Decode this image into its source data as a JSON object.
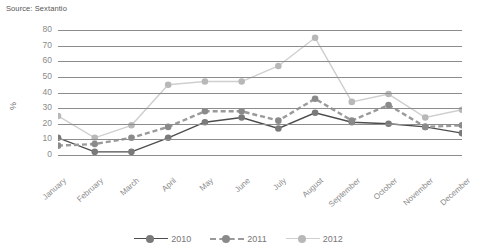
{
  "source": {
    "label": "Source: Sextantio"
  },
  "chart_data": {
    "type": "line",
    "title": "",
    "subtitle": "",
    "xlabel": "",
    "ylabel": "%",
    "ylim": [
      0,
      80
    ],
    "ytick_step": 10,
    "yticks": [
      80,
      70,
      60,
      50,
      40,
      30,
      20,
      10,
      0
    ],
    "grid": true,
    "legend_position": "bottom",
    "categories": [
      "January",
      "February",
      "March",
      "April",
      "May",
      "June",
      "July",
      "August",
      "September",
      "October",
      "November",
      "December"
    ],
    "series": [
      {
        "name": "2010",
        "color": "#4d4d4d",
        "marker_color": "#7a7a7a",
        "dash": "none",
        "values": [
          11,
          2,
          2,
          11,
          21,
          24,
          17,
          27,
          21,
          20,
          18,
          14
        ]
      },
      {
        "name": "2011",
        "color": "#9a9a9a",
        "marker_color": "#8a8a8a",
        "dash": "dashed",
        "values": [
          6,
          7,
          11,
          18,
          28,
          28,
          22,
          36,
          22,
          32,
          18,
          19
        ]
      },
      {
        "name": "2012",
        "color": "#cfcfcf",
        "marker_color": "#b8b8b8",
        "dash": "none",
        "values": [
          25,
          11,
          19,
          45,
          47,
          47,
          57,
          75,
          34,
          39,
          24,
          29
        ]
      }
    ]
  },
  "legend": {
    "items": [
      {
        "label": "2010"
      },
      {
        "label": "2011"
      },
      {
        "label": "2012"
      }
    ]
  }
}
